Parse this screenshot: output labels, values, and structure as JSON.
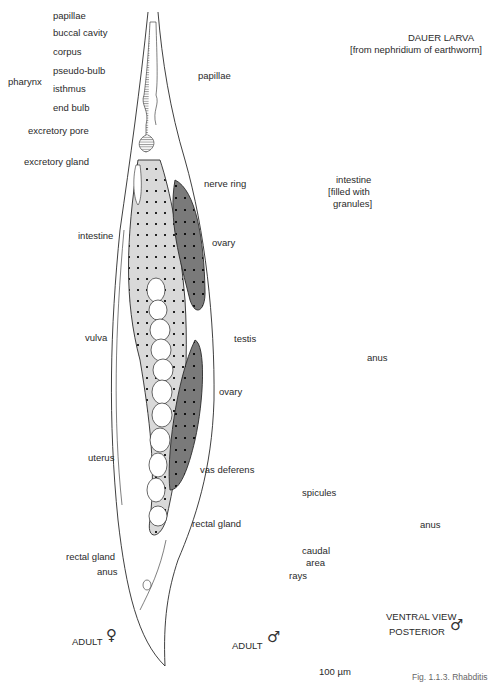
{
  "figure": {
    "caption_fragment": "Fig. 1.1.3. Rhabditis",
    "scale_bar": "100 µm",
    "colors": {
      "outline": "#2a2a2a",
      "intestine_fill": "#d9d9d9",
      "ovary_testis_fill": "#7a7a7a",
      "spicule_fill": "#111111",
      "background": "#ffffff"
    }
  },
  "female": {
    "caption": "ADULT",
    "sex_symbol": "♀",
    "labels": {
      "papillae": "papillae",
      "buccal_cavity": "buccal cavity",
      "pharynx": "pharynx",
      "corpus": "corpus",
      "pseudo_bulb": "pseudo-bulb",
      "isthmus": "isthmus",
      "end_bulb": "end bulb",
      "excretory_pore": "excretory pore",
      "excretory_gland": "excretory gland",
      "intestine": "intestine",
      "ovary_upper": "ovary",
      "vulva": "vulva",
      "ovary_lower": "ovary",
      "uterus": "uterus",
      "rectal_gland": "rectal gland",
      "anus": "anus"
    }
  },
  "male": {
    "caption": "ADULT",
    "sex_symbol": "♂",
    "labels": {
      "papillae": "papillae",
      "nerve_ring": "nerve ring",
      "testis": "testis",
      "vas_deferens": "vas deferens",
      "spicules": "spicules",
      "rectal_gland": "rectal gland",
      "caudal_area_1": "caudal",
      "caudal_area_2": "area",
      "rays": "rays"
    }
  },
  "dauer": {
    "title": "DAUER LARVA",
    "subtitle": "[from nephridium of earthworm]",
    "labels": {
      "intestine_1": "intestine",
      "intestine_2": "[filled with",
      "intestine_3": "granules]",
      "anus": "anus"
    }
  },
  "ventral": {
    "caption_1": "VENTRAL VIEW",
    "caption_2": "POSTERIOR",
    "sex_symbol": "♂",
    "labels": {
      "anus": "anus"
    }
  }
}
